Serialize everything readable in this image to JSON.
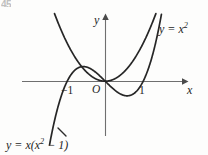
{
  "figure": {
    "number_fragment": "45",
    "background_color": "#fdfdfc",
    "stroke_color": "#262626",
    "axis_color": "#6f6f6f"
  },
  "axes": {
    "x_axis_label": "x",
    "y_axis_label": "y",
    "origin_label": "O",
    "x_tick_negative_one": "−1",
    "x_tick_one": "1"
  },
  "labels": {
    "parabola_prefix": "y = x",
    "parabola_exponent": "2",
    "cubic_lead": "y = x(x",
    "cubic_exponent": "2",
    "cubic_tail": " − 1)"
  },
  "chart_data": {
    "type": "line",
    "title": "",
    "xlabel": "x",
    "ylabel": "y",
    "xlim": [
      -2.1,
      2.1
    ],
    "ylim": [
      -1.9,
      1.8
    ],
    "grid": false,
    "legend": "inline-curve-labels",
    "annotations": [
      {
        "text": "y = x^2",
        "x": 1.45,
        "y": 1.45
      },
      {
        "text": "y = x(x^2 - 1)",
        "x": -2.55,
        "y": -1.65
      }
    ],
    "xticks": [
      -1,
      0,
      1
    ],
    "xticklabels": [
      "-1",
      "O",
      "1"
    ],
    "yticks": [],
    "yticklabels": [],
    "series": [
      {
        "name": "y = x^2",
        "expression": "x^2",
        "color": "#262626",
        "x": [
          -1.45,
          -1.3,
          -1.15,
          -1.0,
          -0.85,
          -0.7,
          -0.55,
          -0.4,
          -0.25,
          -0.1,
          0.0,
          0.1,
          0.25,
          0.4,
          0.55,
          0.7,
          0.85,
          1.0,
          1.15,
          1.3,
          1.45,
          1.6,
          1.72
        ],
        "values": [
          2.1,
          1.69,
          1.32,
          1.0,
          0.72,
          0.49,
          0.3,
          0.16,
          0.06,
          0.01,
          0.0,
          0.01,
          0.06,
          0.16,
          0.3,
          0.49,
          0.72,
          1.0,
          1.32,
          1.69,
          2.1,
          2.56,
          2.96
        ]
      },
      {
        "name": "y = x(x^2 - 1)",
        "expression": "x^3 - x",
        "color": "#262626",
        "x": [
          -1.55,
          -1.4,
          -1.25,
          -1.1,
          -1.0,
          -0.9,
          -0.75,
          -0.577,
          -0.4,
          -0.25,
          -0.1,
          0.0,
          0.1,
          0.25,
          0.4,
          0.577,
          0.75,
          0.9,
          1.0,
          1.1,
          1.25,
          1.4,
          1.5
        ],
        "values": [
          -2.17,
          -1.35,
          -0.7,
          -0.23,
          0.0,
          0.17,
          0.33,
          0.385,
          0.34,
          0.23,
          0.099,
          0.0,
          -0.099,
          -0.23,
          -0.34,
          -0.385,
          -0.33,
          -0.17,
          0.0,
          0.23,
          0.7,
          1.35,
          1.87
        ]
      }
    ],
    "key_points": {
      "cubic_roots": [
        -1,
        0,
        1
      ],
      "cubic_local_max": {
        "x": -0.577,
        "y": 0.385
      },
      "cubic_local_min": {
        "x": 0.577,
        "y": -0.385
      },
      "parabola_vertex": {
        "x": 0,
        "y": 0
      },
      "intersections": [
        {
          "x": 0,
          "y": 0
        },
        {
          "x": 1.325,
          "y": 1.755
        }
      ]
    }
  }
}
